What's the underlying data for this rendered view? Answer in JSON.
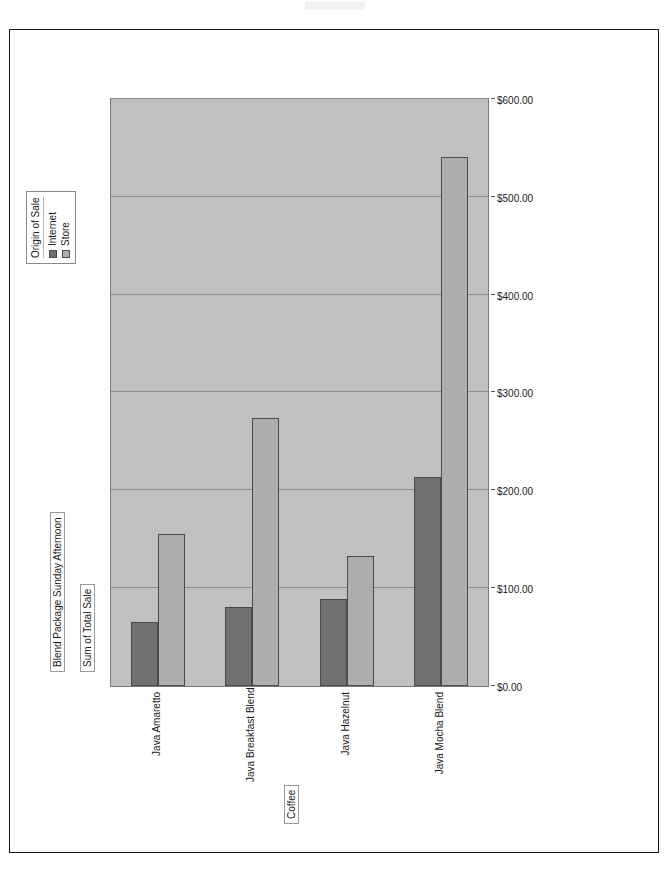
{
  "report": {
    "title": "Blend Package Sunday Afternoon"
  },
  "legend": {
    "title": "Origin of Sale",
    "entries": [
      {
        "label": "Internet",
        "color": "#707070"
      },
      {
        "label": "Store",
        "color": "#adadad"
      }
    ]
  },
  "axes": {
    "category_title": "Coffee",
    "value_title": "Sum of Total Sale"
  },
  "chart_data": {
    "type": "bar",
    "orientation": "horizontal",
    "title": "Blend Package Sunday Afternoon",
    "xlabel": "Sum of Total Sale",
    "ylabel": "Coffee",
    "grid": true,
    "legend_position": "top-right",
    "legend_title": "Origin of Sale",
    "xlim": [
      0,
      600
    ],
    "x_reversed": true,
    "tick_labels": [
      "$600.00",
      "$500.00",
      "$400.00",
      "$300.00",
      "$200.00",
      "$100.00",
      "$0.00"
    ],
    "tick_values": [
      600,
      500,
      400,
      300,
      200,
      100,
      0
    ],
    "categories": [
      "Java Amaretto",
      "Java Breakfast Blend",
      "Java Hazelnut",
      "Java Mocha Blend"
    ],
    "series": [
      {
        "name": "Internet",
        "color": "#707070",
        "values": [
          65,
          81,
          89,
          214
        ]
      },
      {
        "name": "Store",
        "color": "#adadad",
        "values": [
          155,
          274,
          133,
          541
        ]
      }
    ]
  }
}
